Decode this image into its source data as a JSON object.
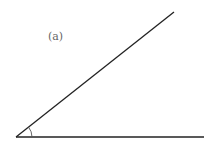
{
  "diagram": {
    "label": "(a)",
    "label_pos": [
      48,
      30
    ],
    "vertex": [
      16,
      137
    ],
    "ray_horizontal_end": [
      204,
      137
    ],
    "ray_inclined_end": [
      174,
      12
    ],
    "arc_radius": 16,
    "line_color": "#222222",
    "arc_color": "#555555"
  }
}
